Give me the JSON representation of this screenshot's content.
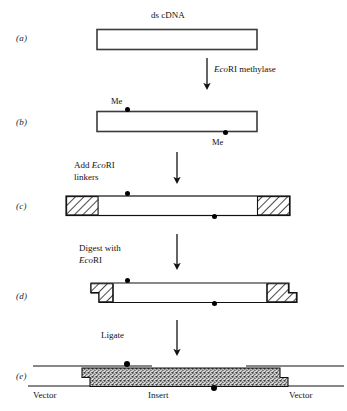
{
  "figure": {
    "title_top": "ds cDNA",
    "panels": [
      {
        "key": "a",
        "label": "(a)"
      },
      {
        "key": "b",
        "label": "(b)"
      },
      {
        "key": "c",
        "label": "(c)"
      },
      {
        "key": "d",
        "label": "(d)"
      },
      {
        "key": "e",
        "label": "(e)"
      }
    ],
    "steps": [
      {
        "key": "methylase",
        "pre": "",
        "enzyme": "Eco",
        "post": "RI methylase",
        "line2": ""
      },
      {
        "key": "linkers",
        "pre": "Add ",
        "enzyme": "Eco",
        "post": "RI",
        "line2": "linkers"
      },
      {
        "key": "digest",
        "pre": "Digest with",
        "enzyme": "Eco",
        "post": "RI",
        "line2": ""
      },
      {
        "key": "ligate",
        "pre": "Ligate",
        "enzyme": "",
        "post": "",
        "line2": ""
      }
    ],
    "methyl_labels": [
      {
        "key": "me-top",
        "text": "Me"
      },
      {
        "key": "me-bottom",
        "text": "Me"
      }
    ],
    "bottom_labels": [
      {
        "key": "vector-left",
        "text": "Vector"
      },
      {
        "key": "insert",
        "text": "Insert"
      },
      {
        "key": "vector-right",
        "text": "Vector"
      }
    ],
    "colors": {
      "stroke": "#111111",
      "background": "#ffffff",
      "hatch": "#222222",
      "insert_fill": "#9a9a9a"
    }
  }
}
